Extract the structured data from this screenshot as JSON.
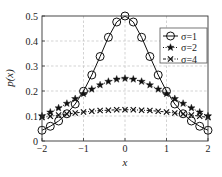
{
  "chart_data": {
    "type": "line",
    "title": "",
    "xlabel": "x",
    "ylabel": "p(x)",
    "xlim": [
      -2,
      2
    ],
    "ylim": [
      0,
      0.5
    ],
    "xticks": [
      -2,
      -1,
      0,
      1,
      2
    ],
    "xtick_labels": [
      "−2",
      "−1",
      "0",
      "1",
      "2"
    ],
    "yticks": [
      0,
      0.1,
      0.2,
      0.3,
      0.4,
      0.5
    ],
    "ytick_labels": [
      "0",
      "0.1",
      "0.2",
      "0.3",
      "0.4",
      "0.5"
    ],
    "grid": true,
    "legend_position": "top-right",
    "x": [
      -2,
      -1.8,
      -1.6,
      -1.4,
      -1.2,
      -1,
      -0.8,
      -0.6,
      -0.4,
      -0.2,
      0,
      0.2,
      0.4,
      0.6,
      0.8,
      1,
      1.2,
      1.4,
      1.6,
      1.8,
      2
    ],
    "series": [
      {
        "name": "σ=1",
        "marker": "circle",
        "line": "solid",
        "values": [
          0.043,
          0.059,
          0.08,
          0.109,
          0.148,
          0.199,
          0.264,
          0.338,
          0.415,
          0.476,
          0.5,
          0.476,
          0.415,
          0.338,
          0.264,
          0.199,
          0.148,
          0.109,
          0.08,
          0.059,
          0.043
        ]
      },
      {
        "name": "σ=2",
        "marker": "star",
        "line": "dotted",
        "values": [
          0.1,
          0.115,
          0.132,
          0.15,
          0.169,
          0.189,
          0.207,
          0.224,
          0.238,
          0.247,
          0.25,
          0.247,
          0.238,
          0.224,
          0.207,
          0.189,
          0.169,
          0.15,
          0.132,
          0.115,
          0.1
        ]
      },
      {
        "name": "σ=4",
        "marker": "x",
        "line": "dashdot",
        "values": [
          0.094,
          0.099,
          0.104,
          0.108,
          0.112,
          0.116,
          0.119,
          0.122,
          0.123,
          0.125,
          0.125,
          0.125,
          0.123,
          0.122,
          0.119,
          0.116,
          0.112,
          0.108,
          0.104,
          0.099,
          0.094
        ]
      }
    ]
  }
}
